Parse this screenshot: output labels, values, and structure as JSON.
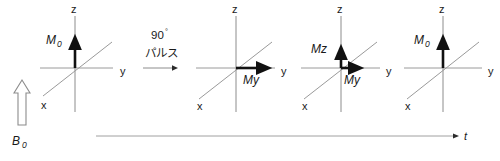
{
  "figure": {
    "background_color": "#ffffff",
    "axis_color": "#8c8c8c",
    "vector_color": "#111111"
  },
  "field": {
    "label": "B",
    "subscript": "0",
    "arrow_name": "b0-field-arrow",
    "direction": "up"
  },
  "pulse": {
    "line1": "90",
    "degree_symbol": "°",
    "line2": "パルス",
    "arrow_name": "pulse-transition-arrow"
  },
  "time_axis": {
    "label": "t",
    "direction": "right"
  },
  "axes_labels": {
    "z": "z",
    "y": "y",
    "x": "x"
  },
  "panels": [
    {
      "id": "panel-equilibrium",
      "origin_x": 75,
      "origin_y": 68,
      "axis_z": "z",
      "axis_y": "y",
      "axis_x": "x",
      "vectors": [
        {
          "name": "m0-vector",
          "label": "M",
          "subscript": "0",
          "direction": "z",
          "length": 32,
          "label_x": 46,
          "label_y": 44
        }
      ]
    },
    {
      "id": "panel-after-90-pulse",
      "origin_x": 236,
      "origin_y": 68,
      "axis_z": "z",
      "axis_y": "y",
      "axis_x": "x",
      "vectors": [
        {
          "name": "my-vector",
          "label": "My",
          "subscript": "",
          "direction": "y",
          "length": 33,
          "label_x": 246,
          "label_y": 84
        }
      ]
    },
    {
      "id": "panel-relaxation",
      "origin_x": 341,
      "origin_y": 68,
      "axis_z": "z",
      "axis_y": "y",
      "axis_x": "x",
      "vectors": [
        {
          "name": "mz-vector",
          "label": "Mz",
          "subscript": "",
          "direction": "z",
          "length": 20,
          "label_x": 311,
          "label_y": 50
        },
        {
          "name": "my-vector",
          "label": "My",
          "subscript": "",
          "direction": "y",
          "length": 19,
          "label_x": 345,
          "label_y": 84
        }
      ]
    },
    {
      "id": "panel-recovered",
      "origin_x": 443,
      "origin_y": 68,
      "axis_z": "z",
      "axis_y": "y",
      "axis_x": "x",
      "vectors": [
        {
          "name": "m0-vector",
          "label": "M",
          "subscript": "0",
          "direction": "z",
          "length": 32,
          "label_x": 414,
          "label_y": 44
        }
      ]
    }
  ]
}
